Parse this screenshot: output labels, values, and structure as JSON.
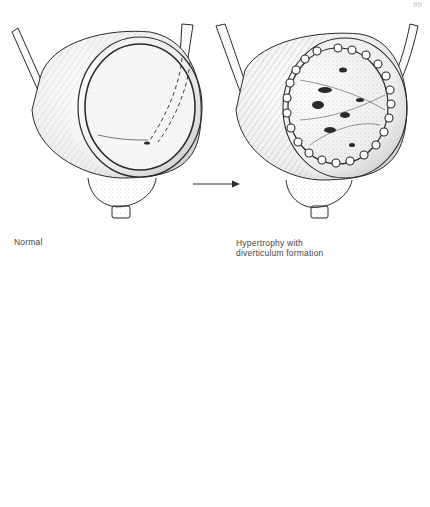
{
  "page": {
    "page_number_fragment": "99"
  },
  "figures": [
    {
      "id": "normal",
      "caption": "Normal",
      "description": "Normal bladder, opened anterior wall showing smooth mucosa, ureters entering posteriorly"
    },
    {
      "id": "hypertrophy",
      "caption_line1": "Hypertrophy with",
      "caption_line2": "diverticulum formation",
      "description": "Bladder with trabeculated hypertrophied wall and small saccules"
    },
    {
      "id": "advanced",
      "caption": "",
      "description": "Bladder with multiple large diverticula and dilated ureters"
    }
  ],
  "arrows": [
    {
      "from": "normal",
      "to": "hypertrophy",
      "direction": "right"
    },
    {
      "from": "hypertrophy",
      "to": "advanced",
      "direction": "curved-down-left"
    }
  ],
  "colors": {
    "ink": "#2a2a2a",
    "stipple": "#9a9a9a",
    "background": "#ffffff"
  }
}
